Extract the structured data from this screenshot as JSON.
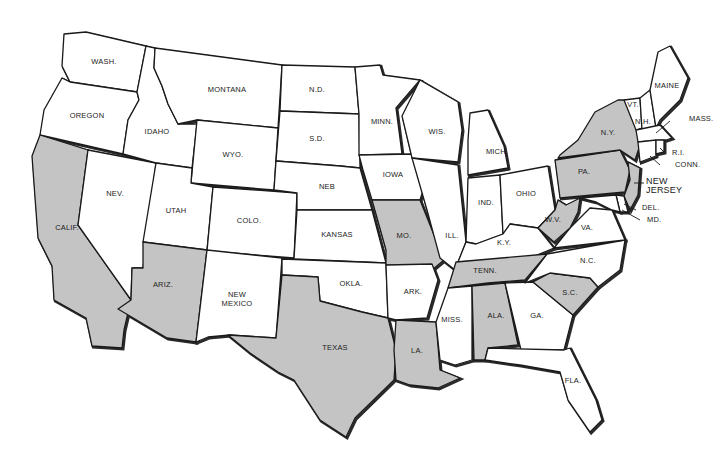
{
  "map": {
    "title": "United States map with selected states shaded",
    "colors": {
      "shaded": "#c4c4c4",
      "unshaded": "#ffffff",
      "border": "#1a1a1a",
      "label": "#222222"
    },
    "shaded_states": [
      "CALIF.",
      "ARIZ.",
      "TEXAS",
      "LA.",
      "MO.",
      "TENN.",
      "ALA.",
      "S.C.",
      "W.V.",
      "PA.",
      "N.Y.",
      "NEW JERSEY"
    ],
    "states": [
      {
        "id": "wa",
        "label": "WASH.",
        "shaded": false,
        "lx": 104,
        "ly": 64,
        "points": "64,34 86,32 146,46 137,92 70,82 62,66"
      },
      {
        "id": "or",
        "label": "OREGON",
        "shaded": false,
        "lx": 87,
        "ly": 118,
        "points": "70,82 137,92 139,100 128,120 123,154 40,135 44,110 62,78"
      },
      {
        "id": "ca",
        "label": "CALIF.",
        "shaded": true,
        "lx": 67,
        "ly": 230,
        "points": "40,135 88,150 78,225 131,300 124,330 122,348 92,346 86,318 54,300 52,266 38,238 34,184 32,156"
      },
      {
        "id": "nv",
        "label": "NEV.",
        "shaded": false,
        "lx": 115,
        "ly": 196,
        "points": "88,150 156,163 143,268 132,268 131,300 78,225"
      },
      {
        "id": "id",
        "label": "IDAHO",
        "shaded": false,
        "lx": 157,
        "ly": 134,
        "points": "146,46 155,48 154,68 162,86 168,104 178,124 197,124 192,168 156,163 123,154 128,120 139,100 137,92"
      },
      {
        "id": "mt",
        "label": "MONTANA",
        "shaded": false,
        "lx": 227,
        "ly": 92,
        "points": "155,48 282,65 278,128 197,120 178,124 168,104 162,86 154,68"
      },
      {
        "id": "wy",
        "label": "WYO.",
        "shaded": false,
        "lx": 233,
        "ly": 157,
        "points": "197,120 278,128 274,190 191,183"
      },
      {
        "id": "ut",
        "label": "UTAH",
        "shaded": false,
        "lx": 176,
        "ly": 213,
        "points": "156,163 192,168 191,183 213,187 207,250 143,242"
      },
      {
        "id": "co",
        "label": "COLO.",
        "shaded": false,
        "lx": 249,
        "ly": 223,
        "points": "213,187 297,193 294,258 207,251"
      },
      {
        "id": "az",
        "label": "ARIZ.",
        "shaded": true,
        "lx": 163,
        "ly": 287,
        "points": "143,242 207,250 196,342 167,338 118,309 131,300 132,268 143,268"
      },
      {
        "id": "nm",
        "label": "NEW MEXICO",
        "shaded": false,
        "lx": 237,
        "ly": 299,
        "points": "207,250 282,258 276,338 230,335 208,337 196,342"
      },
      {
        "id": "nd",
        "label": "N.D.",
        "shaded": false,
        "lx": 317,
        "ly": 92,
        "points": "282,65 355,67 359,114 280,111"
      },
      {
        "id": "sd",
        "label": "S.D.",
        "shaded": false,
        "lx": 317,
        "ly": 141,
        "points": "280,111 359,114 360,168 340,166 276,161"
      },
      {
        "id": "ne",
        "label": "NEB",
        "shaded": false,
        "lx": 327,
        "ly": 189,
        "points": "276,161 340,166 360,168 372,210 297,210 297,193 274,190"
      },
      {
        "id": "ks",
        "label": "KANSAS",
        "shaded": false,
        "lx": 337,
        "ly": 237,
        "points": "297,210 372,210 386,263 294,259"
      },
      {
        "id": "ok",
        "label": "OKLA.",
        "shaded": false,
        "lx": 351,
        "ly": 286,
        "points": "282,259 386,263 388,318 362,312 320,301 318,277 282,275"
      },
      {
        "id": "tx",
        "label": "TEXAS",
        "shaded": true,
        "lx": 335,
        "ly": 350,
        "points": "282,275 318,277 320,301 362,312 388,318 396,350 394,380 355,418 346,437 320,420 294,380 278,372 250,353 228,335 276,338"
      },
      {
        "id": "mn",
        "label": "MINN.",
        "shaded": false,
        "lx": 382,
        "ly": 124,
        "points": "355,67 380,65 383,75 420,80 396,108 402,154 359,155 359,114"
      },
      {
        "id": "ia",
        "label": "IOWA",
        "shaded": false,
        "lx": 393,
        "ly": 177,
        "points": "359,155 412,154 427,178 420,200 372,200 363,170"
      },
      {
        "id": "mo",
        "label": "MO.",
        "shaded": true,
        "lx": 404,
        "ly": 238,
        "points": "372,200 420,200 434,235 444,260 432,270 386,265 386,250"
      },
      {
        "id": "ar",
        "label": "ARK.",
        "shaded": false,
        "lx": 413,
        "ly": 294,
        "points": "386,265 432,264 438,280 427,318 396,320 388,318"
      },
      {
        "id": "la",
        "label": "LA.",
        "shaded": true,
        "lx": 417,
        "ly": 353,
        "points": "396,320 436,322 440,370 460,378 438,388 410,385 396,380 394,350"
      },
      {
        "id": "wi",
        "label": "WIS.",
        "shaded": false,
        "lx": 437,
        "ly": 134,
        "points": "420,80 458,102 462,130 458,162 412,158 402,116"
      },
      {
        "id": "il",
        "label": "ILL.",
        "shaded": false,
        "lx": 452,
        "ly": 238,
        "points": "412,158 458,165 466,242 455,270 440,258 427,210"
      },
      {
        "id": "mi",
        "label": "MICH.",
        "shaded": false,
        "lx": 497,
        "ly": 154,
        "points": "470,113 488,110 504,146 508,168 468,175 468,140"
      },
      {
        "id": "in",
        "label": "IND.",
        "shaded": false,
        "lx": 486,
        "ly": 205,
        "points": "468,178 500,175 503,234 476,244 466,242"
      },
      {
        "id": "oh",
        "label": "OHIO",
        "shaded": false,
        "lx": 526,
        "ly": 196,
        "points": "500,175 548,166 555,210 538,228 510,224 503,234"
      },
      {
        "id": "ky",
        "label": "K.Y.",
        "shaded": false,
        "lx": 504,
        "ly": 245,
        "points": "466,242 476,244 503,234 510,224 538,228 554,248 530,258 458,262"
      },
      {
        "id": "tn",
        "label": "TENN.",
        "shaded": true,
        "lx": 485,
        "ly": 273,
        "points": "456,262 547,254 525,280 488,283 448,288"
      },
      {
        "id": "ms",
        "label": "MISS.",
        "shaded": false,
        "lx": 452,
        "ly": 322,
        "points": "448,288 472,286 472,360 455,365 440,360 436,322"
      },
      {
        "id": "al",
        "label": "ALA.",
        "shaded": true,
        "lx": 496,
        "ly": 318,
        "points": "472,286 505,283 518,345 488,348 485,360 474,360"
      },
      {
        "id": "ga",
        "label": "GA.",
        "shaded": false,
        "lx": 537,
        "ly": 318,
        "points": "505,283 533,282 573,315 564,350 521,350"
      },
      {
        "id": "fl",
        "label": "FLA.",
        "shaded": false,
        "lx": 573,
        "ly": 383,
        "points": "485,360 488,348 564,350 570,348 596,400 602,420 590,432 568,400 560,372 520,365"
      },
      {
        "id": "sc",
        "label": "S.C.",
        "shaded": true,
        "lx": 570,
        "ly": 295,
        "points": "533,282 550,273 590,278 598,287 573,315"
      },
      {
        "id": "nc",
        "label": "N.C.",
        "shaded": false,
        "lx": 588,
        "ly": 263,
        "points": "547,254 625,240 620,270 598,287 590,278 550,273 525,283"
      },
      {
        "id": "va",
        "label": "VA.",
        "shaded": false,
        "lx": 587,
        "ly": 230,
        "points": "554,248 570,228 590,208 612,210 625,240"
      },
      {
        "id": "wv",
        "label": "W.V.",
        "shaded": true,
        "lx": 553,
        "ly": 222,
        "points": "538,228 555,210 558,200 566,205 580,198 578,212 570,228 554,242"
      },
      {
        "id": "pa",
        "label": "PA.",
        "shaded": true,
        "lx": 584,
        "ly": 174,
        "points": "555,160 620,150 630,170 625,192 560,198"
      },
      {
        "id": "ny",
        "label": "N.Y.",
        "shaded": true,
        "lx": 608,
        "ly": 135,
        "points": "560,155 578,140 595,112 618,100 634,100 640,145 635,160 620,150 558,158"
      },
      {
        "id": "nj",
        "label": "NEW JERSEY",
        "shaded": true,
        "lx": 658,
        "ly": 186,
        "points": "628,162 640,168 638,195 630,210 624,196 630,180"
      },
      {
        "id": "de",
        "label": "DEL.",
        "shaded": false,
        "lx": 642,
        "ly": 210,
        "points": "616,195 624,196 628,212 620,212"
      },
      {
        "id": "md",
        "label": "MD.",
        "shaded": false,
        "lx": 647,
        "ly": 222,
        "points": "580,198 616,195 620,212 612,210 596,202"
      },
      {
        "id": "vt",
        "label": "VT.",
        "shaded": false,
        "lx": 633,
        "ly": 107,
        "points": "624,100 640,98 642,128 636,130"
      },
      {
        "id": "nh",
        "label": "N.H.",
        "shaded": false,
        "lx": 643,
        "ly": 124,
        "points": "640,98 650,90 656,128 642,130"
      },
      {
        "id": "me",
        "label": "MAINE",
        "shaded": false,
        "lx": 667,
        "ly": 88,
        "points": "650,90 658,52 670,46 688,78 680,100 660,120 656,128"
      },
      {
        "id": "ma",
        "label": "MASS.",
        "shaded": false,
        "lx": 689,
        "ly": 121,
        "points": "636,130 660,125 672,138 666,140 638,142"
      },
      {
        "id": "ct",
        "label": "CONN.",
        "shaded": false,
        "lx": 675,
        "ly": 167,
        "points": "638,142 656,140 656,156 640,162"
      },
      {
        "id": "ri",
        "label": "R.I.",
        "shaded": false,
        "lx": 672,
        "ly": 155,
        "points": "656,140 664,140 664,152 656,154"
      }
    ],
    "leaders": [
      {
        "for": "MASS.",
        "x1": 670,
        "y1": 121,
        "x2": 656,
        "y2": 133
      },
      {
        "for": "R.I.",
        "x1": 664,
        "y1": 152,
        "x2": 660,
        "y2": 148
      },
      {
        "for": "CONN.",
        "x1": 660,
        "y1": 165,
        "x2": 650,
        "y2": 156
      },
      {
        "for": "NEW JERSEY",
        "x1": 644,
        "y1": 183,
        "x2": 634,
        "y2": 183
      },
      {
        "for": "DEL.",
        "x1": 636,
        "y1": 210,
        "x2": 624,
        "y2": 204
      },
      {
        "for": "MD.",
        "x1": 640,
        "y1": 220,
        "x2": 622,
        "y2": 210
      }
    ]
  }
}
